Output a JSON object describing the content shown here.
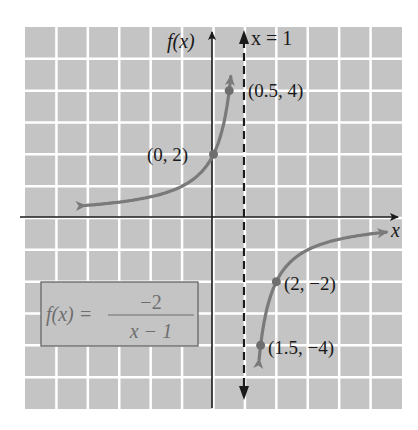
{
  "chart_data": {
    "type": "line",
    "title": "",
    "function_label": "f(x) = -2 / (x - 1)",
    "formula": {
      "lhs": "f(x) =",
      "numerator": "−2",
      "denominator": "x − 1"
    },
    "xlabel": "x",
    "ylabel": "f(x)",
    "asymptote": {
      "label": "x = 1",
      "x": 1,
      "style": "dashed"
    },
    "xlim": [
      -6,
      6
    ],
    "ylim": [
      -6,
      6
    ],
    "grid": true,
    "grid_step": 1,
    "series": [
      {
        "name": "left branch",
        "x": [
          -4.1,
          -3,
          -2,
          -1,
          -0.5,
          0,
          0.25,
          0.5,
          0.55
        ],
        "values": [
          0.39,
          0.5,
          0.67,
          1,
          1.33,
          2,
          2.67,
          4,
          5.3
        ]
      },
      {
        "name": "right branch",
        "x": [
          1.45,
          1.5,
          1.75,
          2,
          3,
          4,
          5.5
        ],
        "values": [
          -4.4,
          -4,
          -2.67,
          -2,
          -1,
          -0.67,
          -0.44
        ]
      }
    ],
    "labeled_points": [
      {
        "x": 0,
        "y": 2,
        "label": "(0, 2)"
      },
      {
        "x": 0.5,
        "y": 4,
        "label": "(0.5, 4)"
      },
      {
        "x": 2,
        "y": -2,
        "label": "(2, −2)"
      },
      {
        "x": 1.5,
        "y": -4,
        "label": "(1.5, −4)"
      }
    ]
  },
  "colors": {
    "grid_background": "#c4c4c4",
    "grid_lines": "#ffffff",
    "axes": "#1a1a1a",
    "curve": "#7a7a7a",
    "formula_text": "#6e6e6e"
  }
}
